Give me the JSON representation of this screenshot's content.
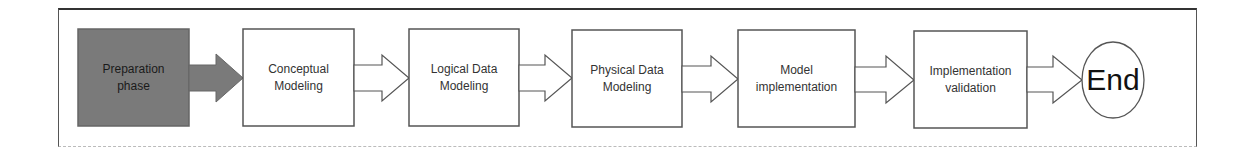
{
  "diagram": {
    "type": "process-flow",
    "steps": [
      {
        "label": "Preparation\nphase",
        "style": "filled",
        "fill": "#7a7a7a"
      },
      {
        "label": "Conceptual\nModeling",
        "style": "outline"
      },
      {
        "label": "Logical Data\nModeling",
        "style": "outline"
      },
      {
        "label": "Physical Data\nModeling",
        "style": "outline"
      },
      {
        "label": "Model\nimplementation",
        "style": "outline"
      },
      {
        "label": "Implementation\nvalidation",
        "style": "outline"
      }
    ],
    "end": {
      "label": "End",
      "shape": "circle"
    },
    "colors": {
      "filled_box": "#7a7a7a",
      "outline": "#555555",
      "text": "#333333"
    }
  }
}
